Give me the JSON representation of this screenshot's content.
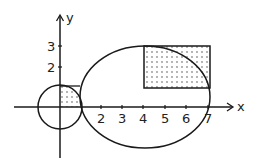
{
  "diagram": {
    "axes": {
      "x_label": "x",
      "y_label": "y",
      "x_ticks": [
        "2",
        "3",
        "4",
        "5",
        "6",
        "7"
      ],
      "y_ticks": [
        "3",
        "2"
      ]
    },
    "shapes": {
      "circle": {
        "center": [
          0,
          0
        ],
        "radius": 1
      },
      "ellipse": {
        "center": [
          4,
          0.5
        ],
        "rx": 3,
        "ry": 2.5
      },
      "rectangle": {
        "x_range": [
          4,
          7
        ],
        "y_range": [
          1,
          3
        ],
        "fill": "dotted"
      },
      "small_region": {
        "x_range": [
          0,
          1
        ],
        "y_range": [
          0,
          1
        ],
        "fill": "dotted",
        "bounded_by": "circle"
      }
    },
    "colors": {
      "stroke": "#1a1a1a",
      "background": "#ffffff"
    }
  }
}
